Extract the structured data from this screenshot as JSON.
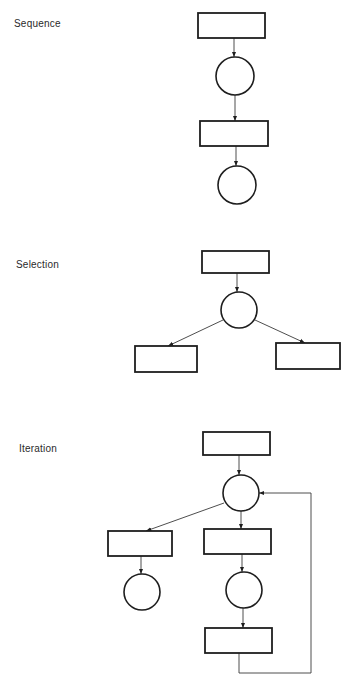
{
  "diagram": {
    "sections": [
      {
        "label": "Sequence",
        "label_pos": [
          14,
          18
        ],
        "nodes": [
          {
            "id": "seq-box-1",
            "type": "box",
            "x": 198,
            "y": 13,
            "w": 67,
            "h": 25
          },
          {
            "id": "seq-circle-1",
            "type": "circle",
            "cx": 235,
            "cy": 76,
            "r": 19
          },
          {
            "id": "seq-box-2",
            "type": "box",
            "x": 200,
            "y": 121,
            "w": 68,
            "h": 25
          },
          {
            "id": "seq-circle-2",
            "type": "circle",
            "cx": 237,
            "cy": 185,
            "r": 19
          }
        ],
        "edges": [
          {
            "from": "seq-box-1",
            "to": "seq-circle-1",
            "points": [
              [
                234,
                38
              ],
              [
                234,
                57
              ]
            ]
          },
          {
            "from": "seq-circle-1",
            "to": "seq-box-2",
            "points": [
              [
                235,
                95
              ],
              [
                235,
                121
              ]
            ]
          },
          {
            "from": "seq-box-2",
            "to": "seq-circle-2",
            "points": [
              [
                236,
                146
              ],
              [
                236,
                166
              ]
            ]
          }
        ]
      },
      {
        "label": "Selection",
        "label_pos": [
          16,
          259
        ],
        "nodes": [
          {
            "id": "sel-box-top",
            "type": "box",
            "x": 202,
            "y": 251,
            "w": 67,
            "h": 22
          },
          {
            "id": "sel-circle",
            "type": "circle",
            "cx": 239,
            "cy": 310,
            "r": 18
          },
          {
            "id": "sel-box-left",
            "type": "box",
            "x": 135,
            "y": 346,
            "w": 62,
            "h": 26
          },
          {
            "id": "sel-box-right",
            "type": "box",
            "x": 276,
            "y": 343,
            "w": 64,
            "h": 26
          }
        ],
        "edges": [
          {
            "from": "sel-box-top",
            "to": "sel-circle",
            "points": [
              [
                237,
                273
              ],
              [
                237,
                292
              ]
            ]
          },
          {
            "from": "sel-circle",
            "to": "sel-box-left",
            "points": [
              [
                223,
                320
              ],
              [
                168,
                346
              ]
            ]
          },
          {
            "from": "sel-circle",
            "to": "sel-box-right",
            "points": [
              [
                255,
                320
              ],
              [
                305,
                343
              ]
            ]
          }
        ]
      },
      {
        "label": "Iteration",
        "label_pos": [
          19,
          443
        ],
        "nodes": [
          {
            "id": "it-box-top",
            "type": "box",
            "x": 203,
            "y": 432,
            "w": 67,
            "h": 23
          },
          {
            "id": "it-circle",
            "type": "circle",
            "cx": 241,
            "cy": 493,
            "r": 18
          },
          {
            "id": "it-box-left",
            "type": "box",
            "x": 108,
            "y": 531,
            "w": 64,
            "h": 25
          },
          {
            "id": "it-circle-left",
            "type": "circle",
            "cx": 142,
            "cy": 592,
            "r": 18
          },
          {
            "id": "it-box-mid",
            "type": "box",
            "x": 204,
            "y": 529,
            "w": 67,
            "h": 25
          },
          {
            "id": "it-circle-mid",
            "type": "circle",
            "cx": 244,
            "cy": 590,
            "r": 18
          },
          {
            "id": "it-box-bottom",
            "type": "box",
            "x": 205,
            "y": 628,
            "w": 67,
            "h": 25
          }
        ],
        "edges": [
          {
            "from": "it-box-top",
            "to": "it-circle",
            "points": [
              [
                239,
                455
              ],
              [
                239,
                475
              ]
            ]
          },
          {
            "from": "it-circle",
            "to": "it-box-left",
            "points": [
              [
                224,
                503
              ],
              [
                146,
                531
              ]
            ]
          },
          {
            "from": "it-circle",
            "to": "it-box-mid",
            "points": [
              [
                241,
                511
              ],
              [
                241,
                529
              ]
            ]
          },
          {
            "from": "it-box-left",
            "to": "it-circle-left",
            "points": [
              [
                141,
                556
              ],
              [
                141,
                574
              ]
            ]
          },
          {
            "from": "it-box-mid",
            "to": "it-circle-mid",
            "points": [
              [
                242,
                554
              ],
              [
                242,
                572
              ]
            ]
          },
          {
            "from": "it-circle-mid",
            "to": "it-box-bottom",
            "points": [
              [
                243,
                608
              ],
              [
                243,
                628
              ]
            ]
          },
          {
            "from": "it-box-bottom",
            "to": "it-circle",
            "points": [
              [
                239,
                653
              ],
              [
                239,
                673
              ],
              [
                311,
                673
              ],
              [
                311,
                493
              ],
              [
                259,
                493
              ]
            ],
            "loop": true
          }
        ]
      }
    ]
  }
}
